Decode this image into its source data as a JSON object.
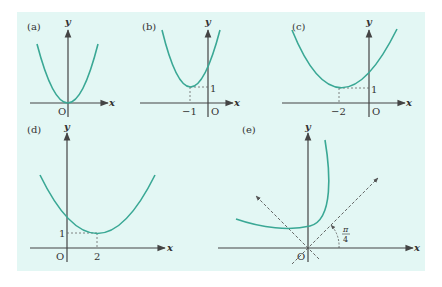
{
  "figure": {
    "background_color": "#e3f7f4",
    "curve_color": "#3aa895",
    "axis_color": "#444444",
    "panels": [
      {
        "id": "a",
        "label": "(a)",
        "x_axis_label": "x",
        "y_axis_label": "y",
        "origin_label": "O",
        "description": "parabola with vertex at origin"
      },
      {
        "id": "b",
        "label": "(b)",
        "x_axis_label": "x",
        "y_axis_label": "y",
        "origin_label": "O",
        "vertex_x_label": "−1",
        "vertex_y_label": "1",
        "description": "parabola with vertex at (−1, 1)"
      },
      {
        "id": "c",
        "label": "(c)",
        "x_axis_label": "x",
        "y_axis_label": "y",
        "origin_label": "O",
        "vertex_x_label": "−2",
        "vertex_y_label": "1",
        "description": "wider parabola with vertex at (−2, 1)"
      },
      {
        "id": "d",
        "label": "(d)",
        "x_axis_label": "x",
        "y_axis_label": "y",
        "origin_label": "O",
        "vertex_x_label": "2",
        "vertex_y_label": "1",
        "description": "parabola with vertex at (2, 1)"
      },
      {
        "id": "e",
        "label": "(e)",
        "x_axis_label": "x",
        "y_axis_label": "y",
        "origin_label": "O",
        "angle_label_num": "π",
        "angle_label_den": "4",
        "description": "parabola rotated by π/4 with dashed rotated axes"
      }
    ]
  }
}
